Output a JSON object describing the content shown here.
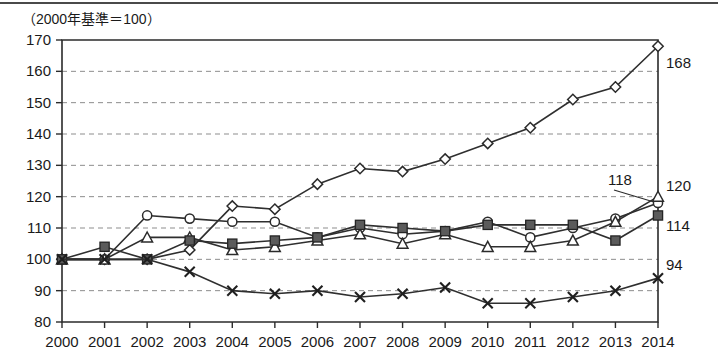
{
  "header": {
    "axis_note": "（2000年基準＝100）"
  },
  "chart_data": {
    "type": "line",
    "title": "",
    "subtitle": "",
    "xlabel": "",
    "ylabel": "",
    "annotation": "（2000年基準＝100）",
    "grid": true,
    "legend_position": "none",
    "xlim": [
      2000,
      2014
    ],
    "ylim": [
      80,
      170
    ],
    "ytick_step": 10,
    "yticks": [
      80,
      90,
      100,
      110,
      120,
      130,
      140,
      150,
      160,
      170
    ],
    "categories": [
      "2000",
      "2001",
      "2002",
      "2003",
      "2004",
      "2005",
      "2006",
      "2007",
      "2008",
      "2009",
      "2010",
      "2011",
      "2012",
      "2013",
      "2014"
    ],
    "x": [
      2000,
      2001,
      2002,
      2003,
      2004,
      2005,
      2006,
      2007,
      2008,
      2009,
      2010,
      2011,
      2012,
      2013,
      2014
    ],
    "series": [
      {
        "name": "series-diamond",
        "marker": "diamond-open",
        "end_label": "168",
        "values": [
          100,
          100,
          100,
          103,
          117,
          116,
          124,
          129,
          128,
          132,
          137,
          142,
          151,
          155,
          168
        ]
      },
      {
        "name": "series-circle",
        "marker": "circle-open",
        "end_label": "118",
        "values": [
          100,
          100,
          114,
          113,
          112,
          112,
          107,
          110,
          108,
          109,
          112,
          107,
          110,
          113,
          118
        ]
      },
      {
        "name": "series-triangle",
        "marker": "triangle-open",
        "end_label": "120",
        "values": [
          100,
          100,
          107,
          107,
          103,
          104,
          106,
          108,
          105,
          108,
          104,
          104,
          106,
          112,
          120
        ]
      },
      {
        "name": "series-square",
        "marker": "square-filled",
        "end_label": "114",
        "values": [
          100,
          104,
          100,
          106,
          105,
          106,
          107,
          111,
          110,
          109,
          111,
          111,
          111,
          106,
          114
        ]
      },
      {
        "name": "series-cross",
        "marker": "x-cross",
        "end_label": "94",
        "values": [
          100,
          100,
          100,
          96,
          90,
          89,
          90,
          88,
          89,
          91,
          86,
          86,
          88,
          90,
          94
        ]
      }
    ],
    "end_labels": [
      {
        "text": "168",
        "for": "series-diamond"
      },
      {
        "text": "118",
        "for": "series-circle"
      },
      {
        "text": "120",
        "for": "series-triangle"
      },
      {
        "text": "114",
        "for": "series-square"
      },
      {
        "text": "94",
        "for": "series-cross"
      }
    ],
    "colors": {
      "line": "#2f2f2f",
      "grid": "#8d8d8d",
      "axis": "#2b2b2b",
      "marker_fill": "#5b5b5b",
      "background": "#ffffff"
    }
  }
}
